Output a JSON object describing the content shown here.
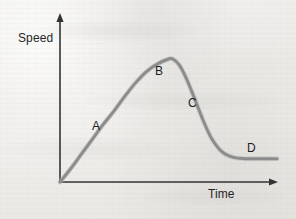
{
  "figure": {
    "name": "speed-time-graph",
    "background_color": "#efeeec"
  },
  "axes": {
    "y": {
      "label": "Speed",
      "color": "#333333",
      "arrow": "up-arrow-icon"
    },
    "x": {
      "label": "Time",
      "color": "#333333",
      "arrow": "right-arrow-icon"
    }
  },
  "curve": {
    "color": "#8c8c8c",
    "width": 3,
    "path": "M 60 182 C 74 166 92 138 107 115 C 122 92 133 72 146 64 C 155 59 165 59 173 59 L 173 60 C 178 72 183 92 190 110 C 197 128 205 144 215 151 C 225 158 240 158 251 158 L 277 158"
  },
  "labels": [
    {
      "id": "A",
      "text": "A",
      "segment": "acceleration"
    },
    {
      "id": "B",
      "text": "B",
      "segment": "peak-plateau"
    },
    {
      "id": "C",
      "text": "C",
      "segment": "deceleration"
    },
    {
      "id": "D",
      "text": "D",
      "segment": "steady-low"
    }
  ],
  "chart_data": {
    "type": "line",
    "title": "",
    "xlabel": "Time",
    "ylabel": "Speed",
    "xlim": [
      0,
      1
    ],
    "ylim": [
      0,
      1
    ],
    "grid": false,
    "legend": null,
    "series": [
      {
        "name": "Speed over time",
        "color": "#8c8c8c",
        "x": [
          0.0,
          0.05,
          0.1,
          0.15,
          0.2,
          0.25,
          0.3,
          0.35,
          0.4,
          0.45,
          0.5,
          0.52,
          0.55,
          0.58,
          0.62,
          0.66,
          0.7,
          0.75,
          0.8,
          0.85,
          0.9,
          1.0
        ],
        "y": [
          0.0,
          0.11,
          0.23,
          0.35,
          0.47,
          0.58,
          0.7,
          0.81,
          0.9,
          0.96,
          1.0,
          1.0,
          0.95,
          0.85,
          0.68,
          0.5,
          0.35,
          0.24,
          0.2,
          0.19,
          0.19,
          0.19
        ]
      }
    ],
    "annotations": [
      {
        "label": "A",
        "x": 0.16,
        "y": 0.4,
        "description": "steep linear rise — constant acceleration"
      },
      {
        "label": "B",
        "x": 0.45,
        "y": 0.96,
        "description": "top of curve flattening to maximum speed"
      },
      {
        "label": "C",
        "x": 0.6,
        "y": 0.72,
        "description": "sharp decrease in speed — deceleration"
      },
      {
        "label": "D",
        "x": 0.88,
        "y": 0.27,
        "description": "constant lower speed — horizontal tail"
      }
    ]
  }
}
